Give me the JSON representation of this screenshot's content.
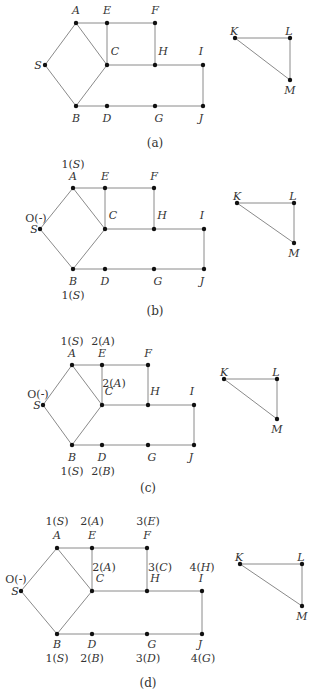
{
  "figure": {
    "panels": [
      {
        "id": "a",
        "caption": "(a)",
        "caption_pos": [
          155,
          147
        ],
        "nodes": {
          "A": {
            "x": 76,
            "y": 23,
            "lx": 76,
            "ly": 14
          },
          "E": {
            "x": 107,
            "y": 23,
            "lx": 107,
            "ly": 14
          },
          "F": {
            "x": 155,
            "y": 23,
            "lx": 155,
            "ly": 14
          },
          "S": {
            "x": 45,
            "y": 65,
            "lx": 38,
            "ly": 69
          },
          "C": {
            "x": 107,
            "y": 65,
            "lx": 115,
            "ly": 55
          },
          "H": {
            "x": 155,
            "y": 65,
            "lx": 163,
            "ly": 55
          },
          "I": {
            "x": 203,
            "y": 65,
            "lx": 201,
            "ly": 55
          },
          "B": {
            "x": 76,
            "y": 106,
            "lx": 76,
            "ly": 122
          },
          "D": {
            "x": 107,
            "y": 106,
            "lx": 107,
            "ly": 122
          },
          "G": {
            "x": 155,
            "y": 106,
            "lx": 159,
            "ly": 122
          },
          "J": {
            "x": 203,
            "y": 106,
            "lx": 201,
            "ly": 122
          },
          "K": {
            "x": 235,
            "y": 38,
            "lx": 234,
            "ly": 35
          },
          "L": {
            "x": 290,
            "y": 38,
            "lx": 289,
            "ly": 35
          },
          "M": {
            "x": 290,
            "y": 80,
            "lx": 290,
            "ly": 94
          }
        },
        "values": []
      },
      {
        "id": "b",
        "caption": "(b)",
        "caption_pos": [
          155,
          315
        ],
        "nodes": {
          "A": {
            "x": 73,
            "y": 188,
            "lx": 73,
            "ly": 180
          },
          "E": {
            "x": 105,
            "y": 188,
            "lx": 105,
            "ly": 180
          },
          "F": {
            "x": 154,
            "y": 188,
            "lx": 154,
            "ly": 180
          },
          "S": {
            "x": 40,
            "y": 229,
            "lx": 34,
            "ly": 233
          },
          "C": {
            "x": 105,
            "y": 229,
            "lx": 113,
            "ly": 219
          },
          "H": {
            "x": 154,
            "y": 229,
            "lx": 162,
            "ly": 219
          },
          "I": {
            "x": 204,
            "y": 229,
            "lx": 202,
            "ly": 219
          },
          "B": {
            "x": 73,
            "y": 269,
            "lx": 73,
            "ly": 285
          },
          "D": {
            "x": 105,
            "y": 269,
            "lx": 105,
            "ly": 285
          },
          "G": {
            "x": 154,
            "y": 269,
            "lx": 158,
            "ly": 285
          },
          "J": {
            "x": 204,
            "y": 269,
            "lx": 202,
            "ly": 285
          },
          "K": {
            "x": 237,
            "y": 203,
            "lx": 237,
            "ly": 200
          },
          "L": {
            "x": 294,
            "y": 203,
            "lx": 293,
            "ly": 200
          },
          "M": {
            "x": 294,
            "y": 243,
            "lx": 294,
            "ly": 257
          }
        },
        "values": [
          {
            "text": "1(S)",
            "x": 73,
            "y": 168
          },
          {
            "text": "O(-)",
            "x": 36,
            "y": 222
          },
          {
            "text": "1(S)",
            "x": 73,
            "y": 299
          }
        ]
      },
      {
        "id": "c",
        "caption": "(c)",
        "caption_pos": [
          148,
          492
        ],
        "nodes": {
          "A": {
            "x": 72,
            "y": 365,
            "lx": 72,
            "ly": 357
          },
          "E": {
            "x": 102,
            "y": 365,
            "lx": 102,
            "ly": 357
          },
          "F": {
            "x": 148,
            "y": 365,
            "lx": 148,
            "ly": 357
          },
          "S": {
            "x": 43,
            "y": 405,
            "lx": 37,
            "ly": 409
          },
          "C": {
            "x": 102,
            "y": 405,
            "lx": 109,
            "ly": 395
          },
          "H": {
            "x": 148,
            "y": 405,
            "lx": 155,
            "ly": 395
          },
          "I": {
            "x": 194,
            "y": 405,
            "lx": 192,
            "ly": 395
          },
          "B": {
            "x": 72,
            "y": 445,
            "lx": 72,
            "ly": 461
          },
          "D": {
            "x": 102,
            "y": 445,
            "lx": 102,
            "ly": 461
          },
          "G": {
            "x": 148,
            "y": 445,
            "lx": 152,
            "ly": 461
          },
          "J": {
            "x": 194,
            "y": 445,
            "lx": 191,
            "ly": 461
          },
          "K": {
            "x": 224,
            "y": 379,
            "lx": 224,
            "ly": 376
          },
          "L": {
            "x": 277,
            "y": 379,
            "lx": 276,
            "ly": 376
          },
          "M": {
            "x": 277,
            "y": 419,
            "lx": 277,
            "ly": 433
          }
        },
        "values": [
          {
            "text": "1(S)",
            "x": 72,
            "y": 345
          },
          {
            "text": "2(A)",
            "x": 103,
            "y": 345
          },
          {
            "text": "2(A)",
            "x": 114,
            "y": 387
          },
          {
            "text": "O(-)",
            "x": 38,
            "y": 398
          },
          {
            "text": "1(S)",
            "x": 72,
            "y": 475
          },
          {
            "text": "2(B)",
            "x": 103,
            "y": 475
          }
        ]
      },
      {
        "id": "d",
        "caption": "(d)",
        "caption_pos": [
          148,
          687
        ],
        "nodes": {
          "A": {
            "x": 57,
            "y": 548,
            "lx": 57,
            "ly": 539
          },
          "E": {
            "x": 92,
            "y": 548,
            "lx": 92,
            "ly": 539
          },
          "F": {
            "x": 147,
            "y": 548,
            "lx": 147,
            "ly": 539
          },
          "S": {
            "x": 21,
            "y": 591,
            "lx": 15,
            "ly": 595
          },
          "C": {
            "x": 92,
            "y": 591,
            "lx": 100,
            "ly": 582
          },
          "H": {
            "x": 147,
            "y": 591,
            "lx": 155,
            "ly": 582
          },
          "I": {
            "x": 202,
            "y": 591,
            "lx": 201,
            "ly": 582
          },
          "B": {
            "x": 57,
            "y": 634,
            "lx": 57,
            "ly": 648
          },
          "D": {
            "x": 92,
            "y": 634,
            "lx": 92,
            "ly": 648
          },
          "G": {
            "x": 147,
            "y": 634,
            "lx": 152,
            "ly": 648
          },
          "J": {
            "x": 202,
            "y": 634,
            "lx": 200,
            "ly": 648
          },
          "K": {
            "x": 240,
            "y": 564,
            "lx": 239,
            "ly": 561
          },
          "L": {
            "x": 302,
            "y": 564,
            "lx": 301,
            "ly": 561
          },
          "M": {
            "x": 302,
            "y": 606,
            "lx": 302,
            "ly": 620
          }
        },
        "values": [
          {
            "text": "1(S)",
            "x": 57,
            "y": 525
          },
          {
            "text": "2(A)",
            "x": 92,
            "y": 525
          },
          {
            "text": "3(E)",
            "x": 148,
            "y": 525
          },
          {
            "text": "2(A)",
            "x": 104,
            "y": 571
          },
          {
            "text": "3(C)",
            "x": 160,
            "y": 571
          },
          {
            "text": "4(H)",
            "x": 202,
            "y": 571
          },
          {
            "text": "O(-)",
            "x": 16,
            "y": 583
          },
          {
            "text": "1(S)",
            "x": 57,
            "y": 662
          },
          {
            "text": "2(B)",
            "x": 92,
            "y": 662
          },
          {
            "text": "3(D)",
            "x": 148,
            "y": 662
          },
          {
            "text": "4(G)",
            "x": 203,
            "y": 662
          }
        ]
      }
    ],
    "edges": [
      [
        "S",
        "A"
      ],
      [
        "S",
        "B"
      ],
      [
        "A",
        "C"
      ],
      [
        "B",
        "C"
      ],
      [
        "A",
        "E"
      ],
      [
        "E",
        "F"
      ],
      [
        "E",
        "C"
      ],
      [
        "F",
        "H"
      ],
      [
        "C",
        "H"
      ],
      [
        "H",
        "I"
      ],
      [
        "I",
        "J"
      ],
      [
        "B",
        "D"
      ],
      [
        "D",
        "G"
      ],
      [
        "G",
        "J"
      ],
      [
        "K",
        "L"
      ],
      [
        "L",
        "M"
      ],
      [
        "K",
        "M"
      ]
    ],
    "colors": {
      "edge": "#8a8a8a",
      "node": "#111111",
      "text": "#333333",
      "background": "#ffffff"
    }
  }
}
